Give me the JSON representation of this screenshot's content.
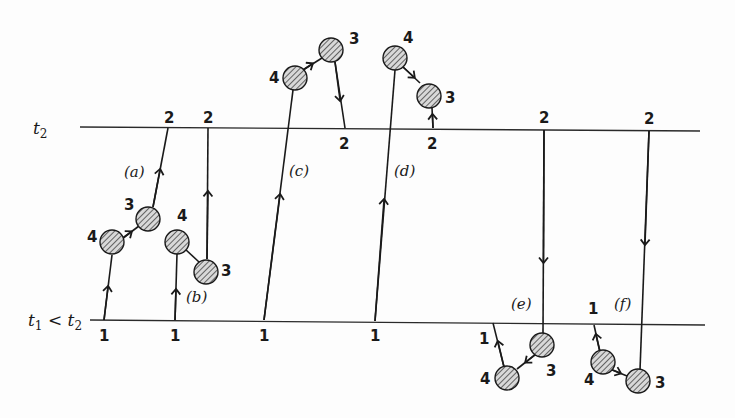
{
  "figure": {
    "time_lines": [
      {
        "id": "t2",
        "label": "t",
        "subscript": "2",
        "y": 129,
        "x1": 80,
        "x2": 700
      },
      {
        "id": "t1",
        "label": "t",
        "subscript": "1",
        "relation": "<",
        "label2": "t",
        "subscript2": "2",
        "y": 325,
        "x1": 90,
        "x2": 705
      }
    ],
    "diagrams": [
      {
        "id": "a",
        "label": "(a)",
        "vertices": {
          "4": "blob",
          "3": "blob"
        },
        "endpoints": {
          "1": "t1",
          "2": "t2"
        }
      },
      {
        "id": "b",
        "label": "(b)",
        "vertices": {
          "4": "blob",
          "3": "blob"
        },
        "endpoints": {
          "1": "t1",
          "2": "t2"
        }
      },
      {
        "id": "c",
        "label": "(c)",
        "vertices": {
          "4": "blob",
          "3": "blob"
        },
        "endpoints": {
          "1": "t1",
          "2": "t2"
        }
      },
      {
        "id": "d",
        "label": "(d)",
        "vertices": {
          "4": "blob",
          "3": "blob"
        },
        "endpoints": {
          "1": "t1",
          "2": "t2"
        }
      },
      {
        "id": "e",
        "label": "(e)",
        "vertices": {
          "4": "blob",
          "3": "blob"
        },
        "endpoints": {
          "1": "t1",
          "2": "t2"
        }
      },
      {
        "id": "f",
        "label": "(f)",
        "vertices": {
          "4": "blob",
          "3": "blob"
        },
        "endpoints": {
          "1": "t1",
          "2": "t2"
        }
      }
    ],
    "numbers": {
      "one": "1",
      "two": "2",
      "three": "3",
      "four": "4"
    },
    "labels": {
      "a": "(a)",
      "b": "(b)",
      "c": "(c)",
      "d": "(d)",
      "e": "(e)",
      "f": "(f)"
    },
    "axis": {
      "t": "t",
      "sub1": "1",
      "sub2": "2",
      "lt": " < "
    },
    "colors": {
      "ink": "#1a1a1a",
      "background": "#fdfdfd"
    }
  }
}
